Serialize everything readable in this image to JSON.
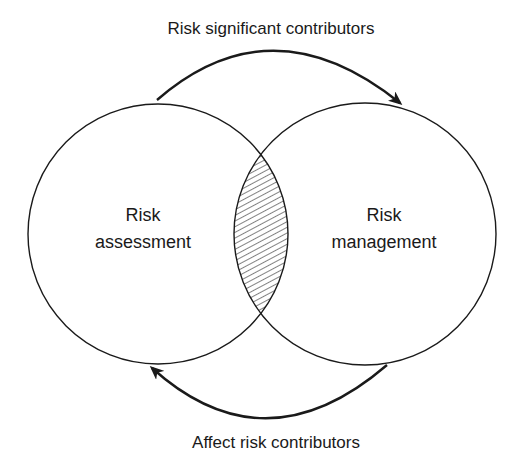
{
  "diagram": {
    "type": "venn",
    "top_arrow_label": "Risk significant contributors",
    "bottom_arrow_label": "Affect risk contributors",
    "left_circle": {
      "line1": "Risk",
      "line2": "assessment"
    },
    "right_circle": {
      "line1": "Risk",
      "line2": "management"
    },
    "intersection": {
      "fill": "hatched"
    },
    "colors": {
      "stroke": "#1a1a1a",
      "background": "#ffffff"
    }
  }
}
